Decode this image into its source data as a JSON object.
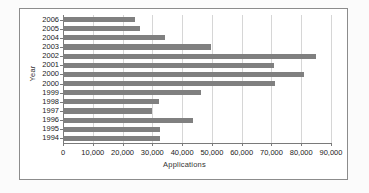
{
  "chart_data": {
    "type": "bar",
    "orientation": "horizontal",
    "title": "",
    "xlabel": "Applications",
    "ylabel": "Year",
    "categories": [
      "2006",
      "2005",
      "2004",
      "2003",
      "2002",
      "2001",
      "2000",
      "2000",
      "1999",
      "1998",
      "1997",
      "1996",
      "1995",
      "1994"
    ],
    "values": [
      24300,
      26000,
      34300,
      49800,
      84800,
      70900,
      80800,
      71300,
      46300,
      32400,
      29900,
      43800,
      32700,
      32700
    ],
    "series": [
      {
        "name": "Applications",
        "values": [
          24300,
          26000,
          34300,
          49800,
          84800,
          70900,
          80800,
          71300,
          46300,
          32400,
          29900,
          43800,
          32700,
          32700
        ]
      }
    ],
    "xlim": [
      0,
      90000
    ],
    "xticks": [
      0,
      10000,
      20000,
      30000,
      40000,
      50000,
      60000,
      70000,
      80000,
      90000
    ],
    "xticklabels": [
      "0",
      "10,000",
      "20,000",
      "30,000",
      "40,000",
      "50,000",
      "60,000",
      "70,000",
      "80,000",
      "90,000"
    ],
    "grid": true,
    "grid_axis": "x",
    "legend": false,
    "bar_color": "#808080",
    "gridline_color": "#d6d6d6",
    "axis_color": "#7a7a7a",
    "background_color": "#ffffff"
  }
}
